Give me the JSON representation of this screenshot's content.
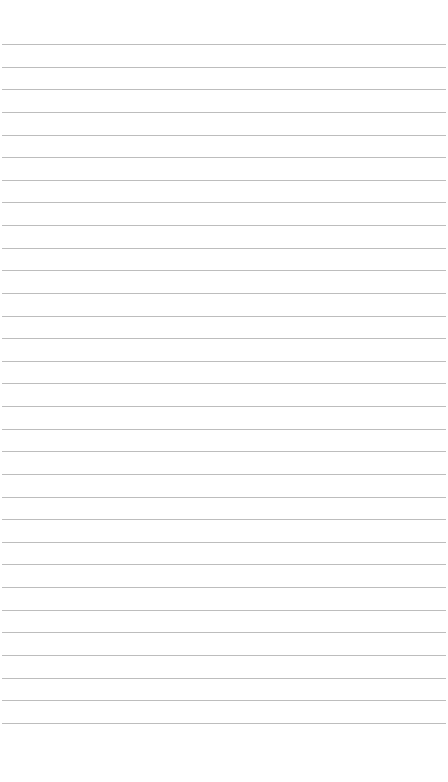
{
  "page": {
    "type": "lined-paper",
    "background_color": "#ffffff",
    "line_color": "#bdbdbd",
    "line_count": 31,
    "first_line_y": 44,
    "line_spacing": 22.63,
    "line_left": 2,
    "line_width": 444,
    "text": ""
  }
}
